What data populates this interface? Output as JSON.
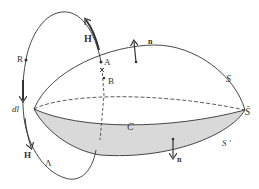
{
  "diagram": {
    "colors": {
      "stroke": "#333333",
      "shade": "#d9d9d9",
      "background": "#ffffff"
    },
    "labels": {
      "H_top": "H",
      "A_top": "A",
      "B": "B",
      "R": "R",
      "dl": "dl",
      "H_bottom": "H",
      "Lambda": "Λ",
      "n_top": "n",
      "n_bottom": "n",
      "S": "S",
      "S_bar": "S̄",
      "S_prime": "S '",
      "C": "C"
    }
  }
}
